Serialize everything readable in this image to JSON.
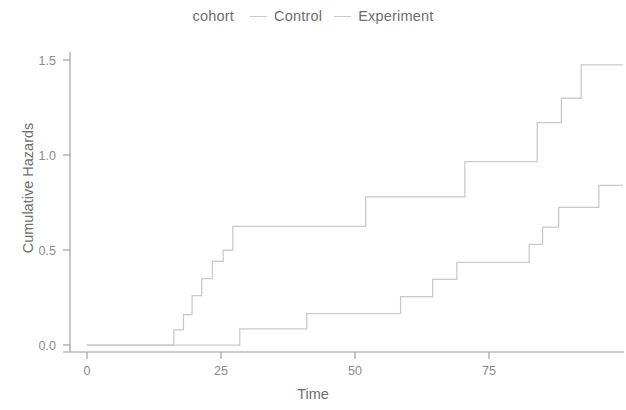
{
  "legend": {
    "title": "cohort",
    "position": "top-center",
    "entries": [
      {
        "label": "Control",
        "color": "#c9c9c9"
      },
      {
        "label": "Experiment",
        "color": "#c9c9c9"
      }
    ]
  },
  "axes": {
    "x_label": "Time",
    "y_label": "Cumulative Hazards",
    "x_ticks": [
      "0",
      "25",
      "50",
      "75"
    ],
    "y_ticks": [
      "0.0",
      "0.5",
      "1.0",
      "1.5"
    ]
  },
  "chart_data": {
    "type": "line",
    "subtype": "step",
    "title": "",
    "xlabel": "Time",
    "ylabel": "Cumulative Hazards",
    "xlim": [
      -3,
      100
    ],
    "ylim": [
      -0.05,
      1.58
    ],
    "x_ticks": [
      0,
      25,
      50,
      75
    ],
    "y_ticks": [
      0.0,
      0.5,
      1.0,
      1.5
    ],
    "grid": false,
    "legend": "top-center",
    "legend_title": "cohort",
    "series": [
      {
        "name": "Control",
        "color": "#c9c9c9",
        "steps": [
          {
            "x": 0,
            "y": 0.0
          },
          {
            "x": 16.2,
            "y": 0.0
          },
          {
            "x": 16.2,
            "y": 0.08
          },
          {
            "x": 18.0,
            "y": 0.08
          },
          {
            "x": 18.0,
            "y": 0.16
          },
          {
            "x": 19.6,
            "y": 0.16
          },
          {
            "x": 19.6,
            "y": 0.26
          },
          {
            "x": 21.4,
            "y": 0.26
          },
          {
            "x": 21.4,
            "y": 0.35
          },
          {
            "x": 23.4,
            "y": 0.35
          },
          {
            "x": 23.4,
            "y": 0.44
          },
          {
            "x": 25.4,
            "y": 0.44
          },
          {
            "x": 25.4,
            "y": 0.5
          },
          {
            "x": 27.2,
            "y": 0.5
          },
          {
            "x": 27.2,
            "y": 0.625
          },
          {
            "x": 52.0,
            "y": 0.625
          },
          {
            "x": 52.0,
            "y": 0.78
          },
          {
            "x": 70.5,
            "y": 0.78
          },
          {
            "x": 70.5,
            "y": 0.965
          },
          {
            "x": 84.0,
            "y": 0.965
          },
          {
            "x": 84.0,
            "y": 1.17
          },
          {
            "x": 88.5,
            "y": 1.17
          },
          {
            "x": 88.5,
            "y": 1.3
          },
          {
            "x": 92.2,
            "y": 1.3
          },
          {
            "x": 92.2,
            "y": 1.475
          },
          {
            "x": 100,
            "y": 1.475
          }
        ]
      },
      {
        "name": "Experiment",
        "color": "#c9c9c9",
        "steps": [
          {
            "x": 0,
            "y": 0.0
          },
          {
            "x": 28.5,
            "y": 0.0
          },
          {
            "x": 28.5,
            "y": 0.085
          },
          {
            "x": 41.0,
            "y": 0.085
          },
          {
            "x": 41.0,
            "y": 0.165
          },
          {
            "x": 58.5,
            "y": 0.165
          },
          {
            "x": 58.5,
            "y": 0.255
          },
          {
            "x": 64.5,
            "y": 0.255
          },
          {
            "x": 64.5,
            "y": 0.345
          },
          {
            "x": 69.0,
            "y": 0.345
          },
          {
            "x": 69.0,
            "y": 0.435
          },
          {
            "x": 82.5,
            "y": 0.435
          },
          {
            "x": 82.5,
            "y": 0.53
          },
          {
            "x": 85.0,
            "y": 0.53
          },
          {
            "x": 85.0,
            "y": 0.62
          },
          {
            "x": 88.0,
            "y": 0.62
          },
          {
            "x": 88.0,
            "y": 0.725
          },
          {
            "x": 95.5,
            "y": 0.725
          },
          {
            "x": 95.5,
            "y": 0.84
          },
          {
            "x": 100,
            "y": 0.84
          }
        ]
      }
    ]
  },
  "style": {
    "background": "#ffffff",
    "axis_color": "#9a9a9a",
    "text_color": "#6e6e6e",
    "line_color": "#c9c9c9"
  }
}
